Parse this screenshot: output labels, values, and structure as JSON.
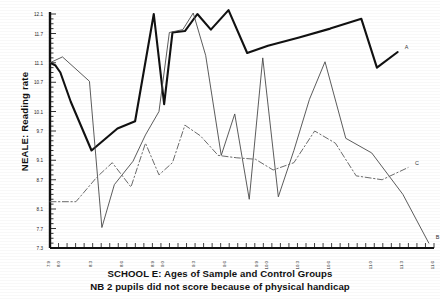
{
  "figure": {
    "ylabel": "NEALE: Reading rate",
    "caption_line1": "SCHOOL E: Ages of Sample and Control Groups",
    "caption_line2": "NB 2 pupils did not score because of physical handicap",
    "series_label_a": "A",
    "series_label_b": "B",
    "series_label_c": "C"
  },
  "chart_data": {
    "type": "line",
    "title": "SCHOOL E: Ages of Sample and Control Groups",
    "subtitle": "NB 2 pupils did not score because of physical handicap",
    "xlabel": "",
    "ylabel": "NEALE: Reading rate",
    "grid": false,
    "legend": "inline-end-labels",
    "xlim": [
      7.9,
      11.6
    ],
    "ylim": [
      7.3,
      12.1
    ],
    "yticks": [
      12.1,
      11.7,
      11.1,
      10.7,
      10.1,
      9.7,
      9.1,
      8.7,
      8.1,
      7.7,
      7.3
    ],
    "ytick_labels": [
      "12.1",
      "11.7",
      "11.1",
      "10.7",
      "10.1",
      "9.7",
      "9.1",
      "8.7",
      "8.1",
      "7.7",
      "7.3"
    ],
    "xticks": [
      7.9,
      8.0,
      8.3,
      8.6,
      8.9,
      9.0,
      9.3,
      9.6,
      9.9,
      10.0,
      10.3,
      10.6,
      11.0,
      11.3,
      11.6
    ],
    "xtick_labels": [
      "7.9",
      "8.0",
      "8.3",
      "8.6",
      "8.9",
      "9.0",
      "9.3",
      "9.6",
      "9.9",
      "10.0",
      "10.3",
      "10.6",
      "11.0",
      "11.3",
      "11.6"
    ],
    "series": [
      {
        "name": "A",
        "style": "solid-thick",
        "color": "#111111",
        "x": [
          7.9,
          7.95,
          8.0,
          8.1,
          8.3,
          8.55,
          8.72,
          8.9,
          9.0,
          9.08,
          9.2,
          9.32,
          9.45,
          9.62,
          9.8,
          10.0,
          10.3,
          10.6,
          10.9,
          11.05,
          11.25
        ],
        "y": [
          11.1,
          11.05,
          10.9,
          10.3,
          9.3,
          9.75,
          9.9,
          12.1,
          10.25,
          11.72,
          11.75,
          12.1,
          11.78,
          12.18,
          11.3,
          11.45,
          11.62,
          11.8,
          12.0,
          11.0,
          11.32
        ]
      },
      {
        "name": "B",
        "style": "solid-thin",
        "color": "#4a4a4a",
        "x": [
          7.9,
          8.02,
          8.28,
          8.4,
          8.52,
          8.7,
          8.82,
          8.95,
          9.05,
          9.18,
          9.28,
          9.4,
          9.55,
          9.68,
          9.82,
          9.95,
          10.1,
          10.25,
          10.4,
          10.55,
          10.75,
          11.0,
          11.3,
          11.55
        ],
        "y": [
          11.1,
          11.22,
          10.72,
          7.72,
          8.6,
          9.08,
          9.62,
          10.1,
          11.72,
          11.78,
          12.12,
          11.25,
          9.2,
          10.05,
          8.3,
          11.2,
          8.35,
          9.3,
          10.35,
          11.12,
          9.55,
          9.25,
          8.4,
          7.4
        ]
      },
      {
        "name": "C",
        "style": "dash-dot",
        "color": "#6b6b6b",
        "x": [
          7.9,
          8.15,
          8.35,
          8.5,
          8.68,
          8.82,
          8.95,
          9.08,
          9.2,
          9.35,
          9.52,
          9.7,
          9.88,
          10.05,
          10.25,
          10.45,
          10.65,
          10.85,
          11.1,
          11.35
        ],
        "y": [
          8.25,
          8.25,
          8.75,
          9.05,
          8.55,
          9.45,
          8.8,
          9.05,
          9.82,
          9.6,
          9.2,
          9.15,
          9.12,
          8.9,
          9.05,
          9.7,
          9.45,
          8.78,
          8.7,
          8.95
        ]
      }
    ]
  }
}
